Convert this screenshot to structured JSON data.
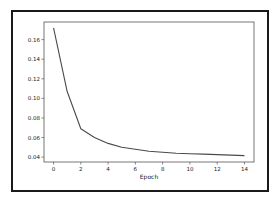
{
  "chart_data": {
    "type": "line",
    "title": "",
    "xlabel": "Epoch",
    "ylabel": "",
    "x": [
      0,
      1,
      2,
      3,
      4,
      5,
      6,
      7,
      8,
      9,
      10,
      11,
      12,
      13,
      14
    ],
    "series": [
      {
        "name": "loss",
        "color": "#4a4a4a",
        "values": [
          0.172,
          0.107,
          0.069,
          0.06,
          0.054,
          0.05,
          0.048,
          0.046,
          0.045,
          0.044,
          0.0435,
          0.043,
          0.0425,
          0.042,
          0.0415
        ]
      }
    ],
    "xlim": [
      -0.7,
      14.7
    ],
    "ylim": [
      0.035,
      0.178
    ],
    "xticks": [
      0,
      2,
      4,
      6,
      8,
      10,
      12,
      14
    ],
    "xtick_labels": [
      "0",
      "2",
      "4",
      "6",
      "8",
      "10",
      "12",
      "14"
    ],
    "yticks": [
      0.04,
      0.06,
      0.08,
      0.1,
      0.12,
      0.14,
      0.16
    ],
    "ytick_labels": [
      "0.04",
      "0.06",
      "0.08",
      "0.10",
      "0.12",
      "0.14",
      "0.16"
    ],
    "grid": false,
    "legend": "none"
  }
}
